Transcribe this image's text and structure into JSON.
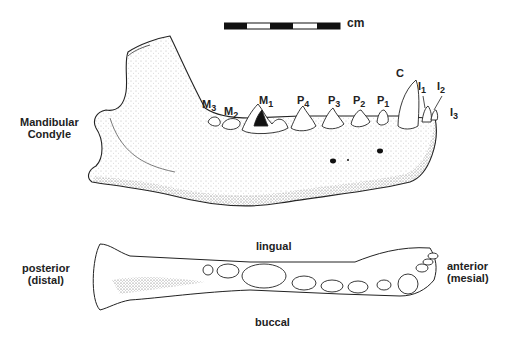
{
  "scale_bar": {
    "unit": "cm",
    "segments": 5
  },
  "lateral_view": {
    "labels": {
      "condyle_line1": "Mandibular",
      "condyle_line2": "Condyle"
    },
    "teeth": [
      {
        "letter": "M",
        "num": "3"
      },
      {
        "letter": "M",
        "num": "2"
      },
      {
        "letter": "M",
        "num": "1"
      },
      {
        "letter": "P",
        "num": "4"
      },
      {
        "letter": "P",
        "num": "3"
      },
      {
        "letter": "P",
        "num": "2"
      },
      {
        "letter": "P",
        "num": "1"
      },
      {
        "letter": "C",
        "num": ""
      },
      {
        "letter": "I",
        "num": "1"
      },
      {
        "letter": "I",
        "num": "2"
      },
      {
        "letter": "I",
        "num": "3"
      }
    ]
  },
  "occlusal_view": {
    "posterior_line1": "posterior",
    "posterior_line2": "(distal)",
    "anterior_line1": "anterior",
    "anterior_line2": "(mesial)",
    "top_label": "lingual",
    "bottom_label": "buccal"
  },
  "colors": {
    "ink": "#1a1a1a",
    "background": "#ffffff"
  }
}
